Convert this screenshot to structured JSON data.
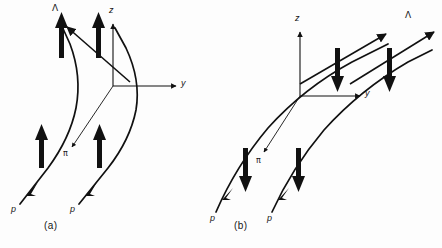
{
  "figure": {
    "background_color": "#fdfdfd",
    "line_color": "#111111",
    "width": 442,
    "height": 248
  },
  "panels": [
    {
      "id": "a",
      "caption": "(a)",
      "caption_pos": {
        "x": 50,
        "y": 224
      },
      "origin": {
        "x": 113,
        "y": 86
      },
      "axes": [
        {
          "name": "z",
          "label": "z",
          "label_pos": {
            "x": 110,
            "y": 10
          },
          "from": {
            "x": 113,
            "y": 86
          },
          "to": {
            "x": 113,
            "y": 22
          }
        },
        {
          "name": "y",
          "label": "y",
          "label_pos": {
            "x": 186,
            "y": 82
          },
          "from": {
            "x": 113,
            "y": 86
          },
          "to": {
            "x": 178,
            "y": 86
          }
        },
        {
          "name": "pi",
          "label": "π",
          "label_pos": {
            "x": 65,
            "y": 150
          },
          "from": {
            "x": 113,
            "y": 86
          },
          "to": {
            "x": 72,
            "y": 145
          }
        }
      ],
      "lambda_label": {
        "text": "Λ",
        "x": 53,
        "y": 6
      },
      "tracks": [
        {
          "name": "proton-track-left",
          "label": "p",
          "label_pos": {
            "x": 12,
            "y": 208
          }
        },
        {
          "name": "proton-track-right",
          "label": "p",
          "label_pos": {
            "x": 72,
            "y": 208
          }
        }
      ],
      "spin_arrows": [
        {
          "name": "spin-up-left-upper",
          "direction": "up",
          "x": 62,
          "y_top": 18,
          "y_bottom": 58
        },
        {
          "name": "spin-up-center-upper",
          "direction": "up",
          "x": 99,
          "y_top": 18,
          "y_bottom": 58
        },
        {
          "name": "spin-up-left-lower",
          "direction": "up",
          "x": 42,
          "y_top": 128,
          "y_bottom": 168
        },
        {
          "name": "spin-up-right-lower",
          "direction": "up",
          "x": 100,
          "y_top": 128,
          "y_bottom": 168
        }
      ],
      "lambda_arrow_direction": "up-left"
    },
    {
      "id": "b",
      "caption": "(b)",
      "caption_pos": {
        "x": 240,
        "y": 224
      },
      "origin": {
        "x": 300,
        "y": 96
      },
      "axes": [
        {
          "name": "z",
          "label": "z",
          "label_pos": {
            "x": 296,
            "y": 18
          },
          "from": {
            "x": 300,
            "y": 96
          },
          "to": {
            "x": 300,
            "y": 30
          }
        },
        {
          "name": "y",
          "label": "y",
          "label_pos": {
            "x": 370,
            "y": 92
          },
          "from": {
            "x": 300,
            "y": 96
          },
          "to": {
            "x": 362,
            "y": 96
          }
        },
        {
          "name": "pi",
          "label": "π",
          "label_pos": {
            "x": 257,
            "y": 160
          },
          "from": {
            "x": 300,
            "y": 96
          },
          "to": {
            "x": 264,
            "y": 155
          }
        }
      ],
      "lambda_label": {
        "text": "Λ",
        "x": 406,
        "y": 12
      },
      "tracks": [
        {
          "name": "proton-track-left",
          "label": "p",
          "label_pos": {
            "x": 211,
            "y": 218
          }
        },
        {
          "name": "proton-track-right",
          "label": "p",
          "label_pos": {
            "x": 268,
            "y": 218
          }
        }
      ],
      "spin_arrows": [
        {
          "name": "spin-down-upper-left",
          "direction": "down",
          "x": 337,
          "y_top": 50,
          "y_bottom": 90
        },
        {
          "name": "spin-down-upper-right",
          "direction": "down",
          "x": 389,
          "y_top": 50,
          "y_bottom": 90
        },
        {
          "name": "spin-down-lower-left",
          "direction": "down",
          "x": 245,
          "y_top": 150,
          "y_bottom": 190
        },
        {
          "name": "spin-down-lower-right",
          "direction": "down",
          "x": 298,
          "y_top": 150,
          "y_bottom": 190
        }
      ],
      "lambda_arrow_direction": "up-right"
    }
  ]
}
